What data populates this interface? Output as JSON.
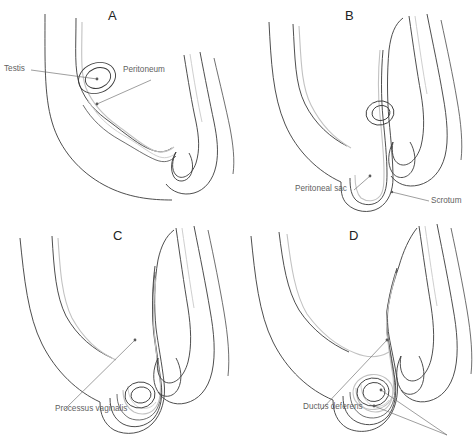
{
  "figure": {
    "background_color": "#ffffff",
    "line_color_dark": "#3a3a3a",
    "line_color_peritoneum": "#c2c2c2",
    "label_color": "#5f5f5f",
    "letter_color": "#222222"
  },
  "panels": [
    {
      "id": "A",
      "letter": "A",
      "annotations": [
        {
          "name": "testis",
          "text": "Testis"
        },
        {
          "name": "peritoneum",
          "text": "Peritoneum"
        }
      ]
    },
    {
      "id": "B",
      "letter": "B",
      "annotations": [
        {
          "name": "peritoneal-sac",
          "text": "Peritoneal sac"
        },
        {
          "name": "scrotum",
          "text": "Scrotum"
        }
      ]
    },
    {
      "id": "C",
      "letter": "C",
      "annotations": [
        {
          "name": "processus-vaginalis",
          "text": "Processus vaginalis"
        }
      ]
    },
    {
      "id": "D",
      "letter": "D",
      "annotations": [
        {
          "name": "ductus-deferens",
          "text": "Ductus deferens"
        }
      ]
    }
  ]
}
